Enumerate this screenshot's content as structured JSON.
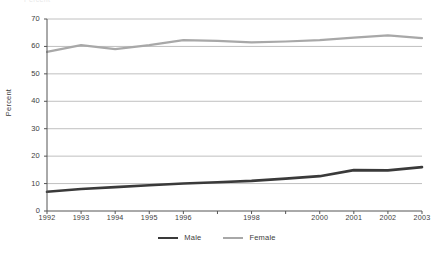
{
  "chart_data": {
    "type": "line",
    "title": "",
    "xlabel": "",
    "ylabel": "Percent",
    "ylim": [
      0,
      70
    ],
    "ytick_step": 10,
    "yticks": [
      "0",
      "10",
      "20",
      "30",
      "40",
      "50",
      "60",
      "70"
    ],
    "grid": true,
    "grid_orientation": "horizontal",
    "legend_position": "bottom-center",
    "x": [
      1992,
      1993,
      1994,
      1995,
      1996,
      1997,
      1998,
      1999,
      2000,
      2001,
      2002,
      2003
    ],
    "categories": [
      "1992",
      "1993",
      "1994",
      "1995",
      "1996",
      "",
      "1998",
      "",
      "2000",
      "2001",
      "2002",
      "2003"
    ],
    "xtick_labels": [
      "1992",
      "1993",
      "1994",
      "1995",
      "1996",
      "1998",
      "2000",
      "2001",
      "2002",
      "2003"
    ],
    "series": [
      {
        "name": "Male",
        "color": "#3a3a3a",
        "line_width": 2.6,
        "values": [
          7.0,
          8.0,
          8.7,
          9.4,
          10.0,
          10.5,
          11.0,
          11.8,
          12.7,
          14.9,
          14.8,
          16.0
        ]
      },
      {
        "name": "Female",
        "color": "#a8a8a8",
        "line_width": 2.2,
        "values": [
          58.0,
          60.5,
          59.0,
          60.5,
          62.3,
          62.0,
          61.5,
          61.8,
          62.3,
          63.2,
          64.0,
          63.0
        ]
      }
    ]
  },
  "axes": {
    "y_title": "Percent"
  },
  "legend": {
    "items": [
      {
        "label": "Male"
      },
      {
        "label": "Female"
      }
    ]
  },
  "colors": {
    "male": "#3a3a3a",
    "female": "#a8a8a8",
    "axis": "#555555",
    "grid": "#b9b9b9",
    "text": "#3d3d3d"
  },
  "title_clip": {
    "text": "Percent"
  }
}
